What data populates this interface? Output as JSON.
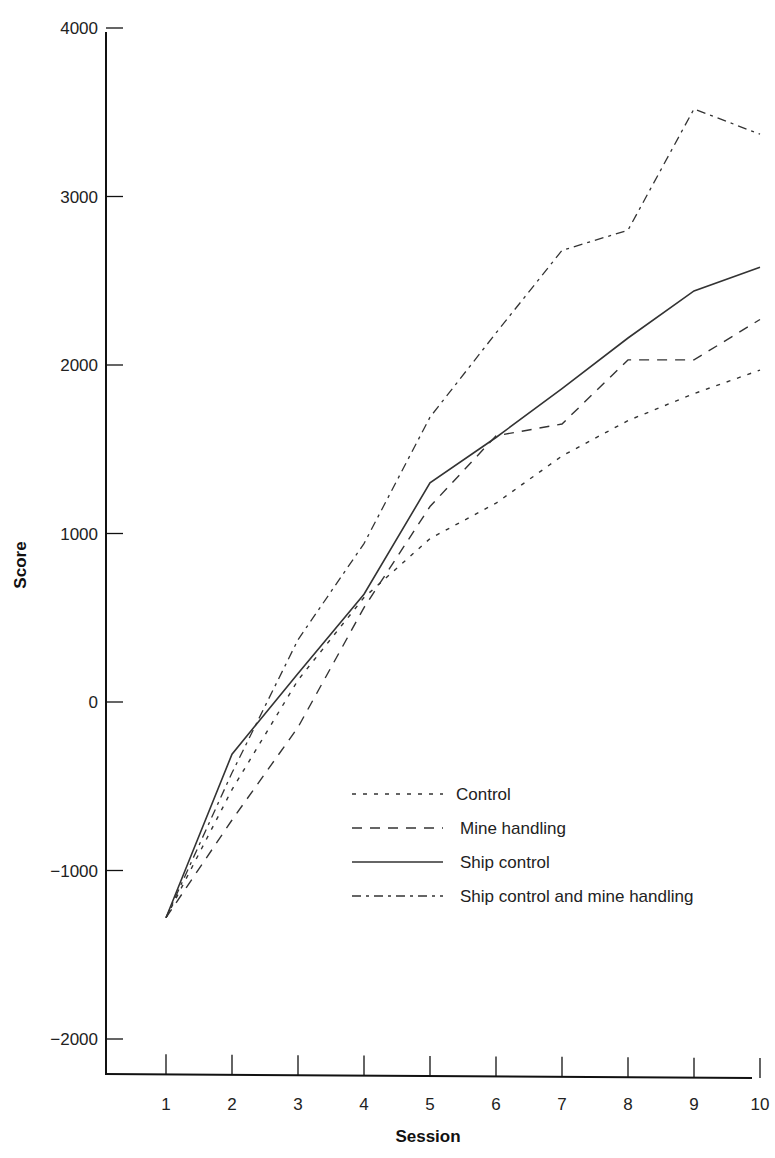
{
  "chart_data": {
    "type": "line",
    "title": "",
    "xlabel": "Session",
    "ylabel": "Score",
    "x": [
      1,
      2,
      3,
      4,
      5,
      6,
      7,
      8,
      9,
      10
    ],
    "x_tick_labels": [
      "1",
      "2",
      "3",
      "4",
      "5",
      "6",
      "7",
      "8",
      "9",
      "10"
    ],
    "y_ticks": [
      -2000,
      -1000,
      0,
      1000,
      2000,
      3000,
      4000
    ],
    "y_tick_labels": [
      "−2000",
      "−1000",
      "0",
      "1000",
      "2000",
      "3000",
      "4000"
    ],
    "ylim": [
      -2200,
      4000
    ],
    "xlim": [
      0,
      10
    ],
    "grid": false,
    "legend_position": "inside lower right",
    "series": [
      {
        "name": "Control",
        "style": "dotted",
        "values": [
          -1280,
          -520,
          130,
          620,
          970,
          1180,
          1460,
          1670,
          1830,
          1970
        ]
      },
      {
        "name": "Mine handling",
        "style": "dashed",
        "values": [
          -1280,
          -700,
          -150,
          560,
          1160,
          1580,
          1650,
          2030,
          2030,
          2270
        ]
      },
      {
        "name": "Ship control",
        "style": "solid",
        "values": [
          -1280,
          -310,
          170,
          640,
          1300,
          1570,
          1860,
          2160,
          2440,
          2580
        ]
      },
      {
        "name": "Ship control and mine handling",
        "style": "dash-dot",
        "values": [
          -1280,
          -420,
          370,
          940,
          1690,
          2190,
          2680,
          2800,
          3520,
          3370
        ]
      }
    ]
  },
  "colors": {
    "axis": "#111111",
    "line": "#333333",
    "background": "#ffffff"
  }
}
